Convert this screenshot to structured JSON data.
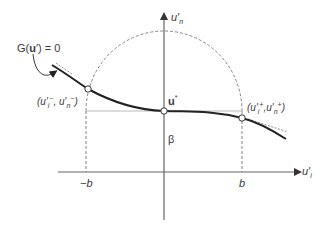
{
  "diagram": {
    "axes": {
      "vertical_label": "u′n",
      "vertical_label_main": "u′",
      "vertical_label_sub": "n",
      "horizontal_label_main": "u′",
      "horizontal_label_sub": "i"
    },
    "ticks": {
      "neg_b": "−b",
      "pos_b": "b"
    },
    "labels": {
      "constraint": "G(u′) = 0",
      "constraint_prefix": "G(",
      "constraint_bold": "u",
      "constraint_suffix": "′) = 0",
      "ustar": "u*",
      "ustar_main": "u",
      "ustar_sup": "*",
      "beta": "β",
      "left_point": "(u′i−, u′n−)",
      "left_point_text": "(u′",
      "left_point_i": "i",
      "left_point_sup1": "−",
      "left_point_mid": ", u′",
      "left_point_n": "n",
      "left_point_sup2": "−",
      "left_point_end": ")",
      "right_point": "(u′i+, u′n+)",
      "right_point_text": "(u′",
      "right_point_i": "i",
      "right_point_sup1": "+",
      "right_point_mid": ",u′",
      "right_point_n": "n",
      "right_point_sup2": "+",
      "right_point_end": ")"
    },
    "colors": {
      "axis": "#555555",
      "curve": "#222222",
      "dashed": "#777777",
      "guide": "#aaaaaa"
    }
  }
}
